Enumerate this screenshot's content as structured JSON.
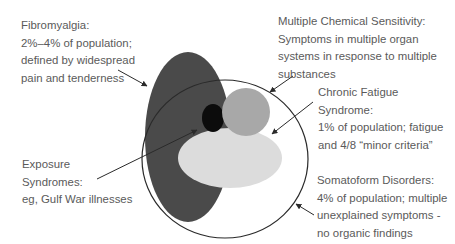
{
  "labels": {
    "fibromyalgia": {
      "lines": [
        "Fibromyalgia:",
        "2%–4% of population;",
        "defined by widespread",
        "pain and tenderness"
      ]
    },
    "mcs": {
      "lines": [
        "Multiple Chemical Sensitivity:",
        "Symptoms in multiple organ",
        "systems in response to multiple",
        "substances"
      ]
    },
    "cfs": {
      "lines": [
        "Chronic Fatigue",
        "Syndrome:",
        "1% of population; fatigue",
        "and 4/8 “minor criteria”"
      ]
    },
    "exposure": {
      "lines": [
        "Exposure",
        "Syndromes:",
        "eg, Gulf War illnesses"
      ]
    },
    "somatoform": {
      "lines": [
        "Somatoform Disorders:",
        "4% of population; multiple",
        "unexplained symptoms -",
        "no organic findings"
      ]
    }
  },
  "colors": {
    "fibromyalgia_fill": "#4a4a4a",
    "mcs_fill": "#a8a8a8",
    "cfs_fill": "#dcdcdc",
    "exposure_fill": "#0c0c0c",
    "somatoform_outline": "#2a2a2a",
    "text": "#5a5a5a"
  }
}
